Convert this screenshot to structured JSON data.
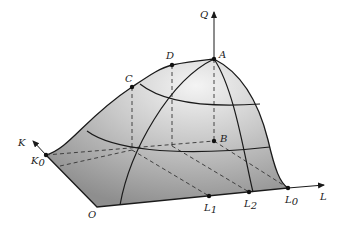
{
  "figure": {
    "axes": {
      "q_axis_label": "Q",
      "k_axis_label": "K",
      "l_axis_label": "L"
    },
    "points": {
      "A": {
        "label": "A"
      },
      "B": {
        "label": "B"
      },
      "C": {
        "label": "C"
      },
      "D": {
        "label": "D"
      },
      "O": {
        "label": "O"
      },
      "K0": {
        "label": "K",
        "sub": "0"
      },
      "L0": {
        "label": "L",
        "sub": "0"
      },
      "L1": {
        "label": "L",
        "sub": "1"
      },
      "L2": {
        "label": "L",
        "sub": "2"
      }
    },
    "colors": {
      "surface_light": "#f2f2f2",
      "surface_dark": "#8c8c8c",
      "line": "#1a1a1a",
      "dashed": "#333333"
    }
  }
}
